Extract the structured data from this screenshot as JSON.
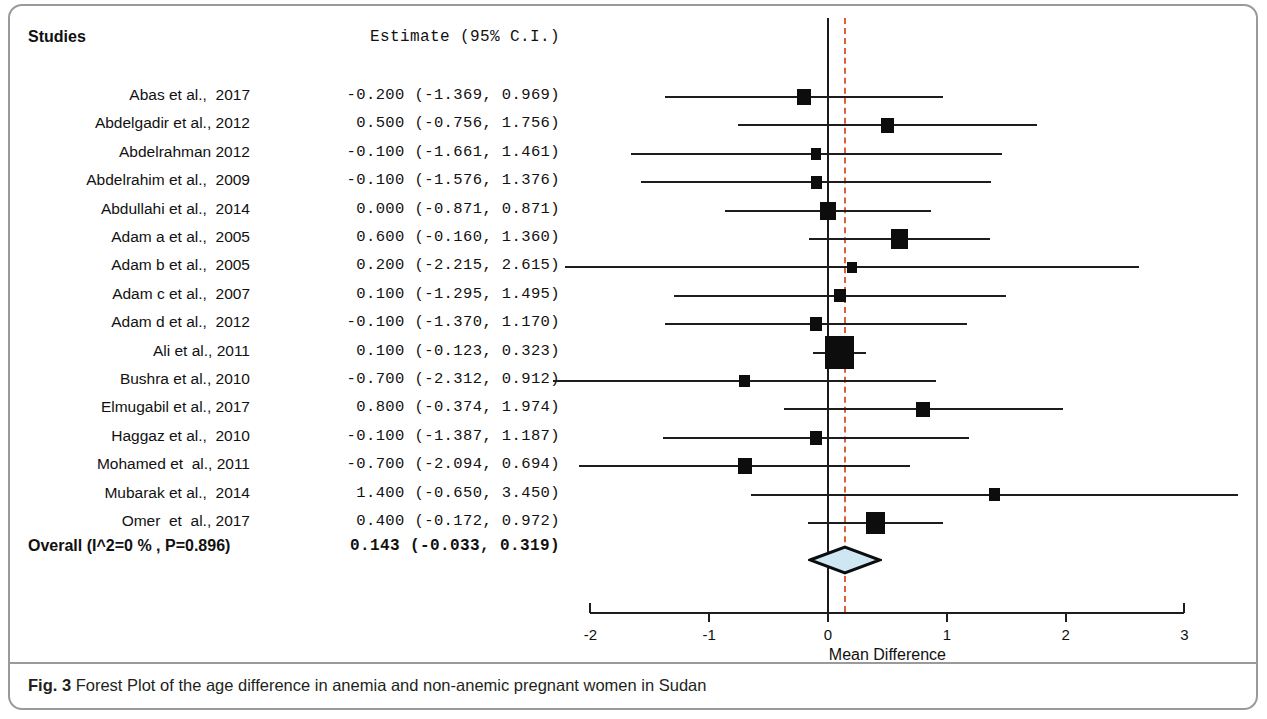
{
  "figure": {
    "label": "Fig. 3",
    "caption": " Forest Plot of the age difference in anemia and non-anemic pregnant women in Sudan"
  },
  "headers": {
    "studies": "Studies",
    "estimate": "Estimate (95% C.I.)"
  },
  "axis": {
    "title": "Mean Difference",
    "ticks": [
      "-2",
      "-1",
      "0",
      "1",
      "2",
      "3"
    ],
    "tick_values": [
      -2,
      -1,
      0,
      1,
      2,
      3
    ],
    "min": -2,
    "max": 3
  },
  "overall": {
    "label": "Overall (I^2=0 % , P=0.896)",
    "estimate_text": "0.143 (-0.033, 0.319)",
    "estimate": 0.143,
    "lower": -0.033,
    "upper": 0.319
  },
  "colors": {
    "marker": "#0d0d0d",
    "reference_line": "#d9603b",
    "zero_line": "#1a1a1a",
    "diamond_fill": "#cfe7f3",
    "diamond_stroke": "#0d0d0d",
    "card_border": "#9a9a9a"
  },
  "chart_data": {
    "type": "forest",
    "title": "Forest Plot of the age difference in anemia and non-anemic pregnant women in Sudan",
    "xlabel": "Mean Difference",
    "ylabel": "",
    "xlim": [
      -2,
      3
    ],
    "xticks": [
      -2,
      -1,
      0,
      1,
      2,
      3
    ],
    "grid": false,
    "legend": "none",
    "reference_line": 0.143,
    "null_line": 0,
    "columns": [
      "Studies",
      "Estimate (95% C.I.)"
    ],
    "rows": [
      {
        "study": "Abas et al.,  2017",
        "estimate_text": "-0.200 (-1.369, 0.969)",
        "estimate": -0.2,
        "lower": -1.369,
        "upper": 0.969,
        "weight": 0.3
      },
      {
        "study": "Abdelgadir et al., 2012",
        "estimate_text": " 0.500 (-0.756, 1.756)",
        "estimate": 0.5,
        "lower": -0.756,
        "upper": 1.756,
        "weight": 0.26
      },
      {
        "study": "Abdelrahman 2012",
        "estimate_text": "-0.100 (-1.661, 1.461)",
        "estimate": -0.1,
        "lower": -1.661,
        "upper": 1.461,
        "weight": 0.17
      },
      {
        "study": "Abdelrahim et al.,  2009",
        "estimate_text": "-0.100 (-1.576, 1.376)",
        "estimate": -0.1,
        "lower": -1.576,
        "upper": 1.376,
        "weight": 0.19
      },
      {
        "study": "Abdullahi et al.,  2014",
        "estimate_text": " 0.000 (-0.871, 0.871)",
        "estimate": 0.0,
        "lower": -0.871,
        "upper": 0.871,
        "weight": 0.4
      },
      {
        "study": "Adam a et al.,  2005",
        "estimate_text": " 0.600 (-0.160, 1.360)",
        "estimate": 0.6,
        "lower": -0.16,
        "upper": 1.36,
        "weight": 0.45
      },
      {
        "study": "Adam b et al.,  2005",
        "estimate_text": " 0.200 (-2.215, 2.615)",
        "estimate": 0.2,
        "lower": -2.215,
        "upper": 2.615,
        "weight": 0.14
      },
      {
        "study": "Adam c et al.,  2007",
        "estimate_text": " 0.100 (-1.295, 1.495)",
        "estimate": 0.1,
        "lower": -1.295,
        "upper": 1.495,
        "weight": 0.21
      },
      {
        "study": "Adam d et al.,  2012",
        "estimate_text": "-0.100 (-1.370, 1.170)",
        "estimate": -0.1,
        "lower": -1.37,
        "upper": 1.17,
        "weight": 0.24
      },
      {
        "study": "Ali et al., 2011",
        "estimate_text": " 0.100 (-0.123, 0.323)",
        "estimate": 0.1,
        "lower": -0.123,
        "upper": 0.323,
        "weight": 1.0
      },
      {
        "study": "Bushra et al., 2010",
        "estimate_text": "-0.700 (-2.312, 0.912)",
        "estimate": -0.7,
        "lower": -2.312,
        "upper": 0.912,
        "weight": 0.18
      },
      {
        "study": "Elmugabil et al., 2017",
        "estimate_text": " 0.800 (-0.374, 1.974)",
        "estimate": 0.8,
        "lower": -0.374,
        "upper": 1.974,
        "weight": 0.28
      },
      {
        "study": "Haggaz et al.,  2010",
        "estimate_text": "-0.100 (-1.387, 1.187)",
        "estimate": -0.1,
        "lower": -1.387,
        "upper": 1.187,
        "weight": 0.24
      },
      {
        "study": "Mohamed et  al., 2011",
        "estimate_text": "-0.700 (-2.094, 0.694)",
        "estimate": -0.7,
        "lower": -2.094,
        "upper": 0.694,
        "weight": 0.3
      },
      {
        "study": "Mubarak et al.,  2014",
        "estimate_text": " 1.400 (-0.650, 3.450)",
        "estimate": 1.4,
        "lower": -0.65,
        "upper": 3.45,
        "weight": 0.2
      },
      {
        "study": "Omer  et  al., 2017",
        "estimate_text": " 0.400 (-0.172, 0.972)",
        "estimate": 0.4,
        "lower": -0.172,
        "upper": 0.972,
        "weight": 0.55
      }
    ],
    "summary": {
      "label": "Overall (I^2=0 % , P=0.896)",
      "estimate": 0.143,
      "lower": -0.033,
      "upper": 0.319,
      "estimate_text": "0.143 (-0.033, 0.319)",
      "heterogeneity_i2": "0 %",
      "p_value": "0.896"
    }
  }
}
